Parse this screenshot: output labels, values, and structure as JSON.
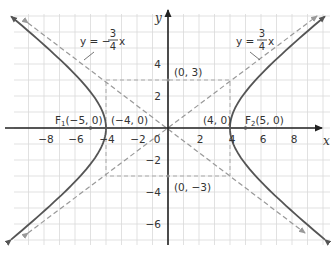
{
  "chart_data": {
    "type": "line",
    "title": "",
    "xlabel": "x",
    "ylabel": "y",
    "xlim": [
      -10,
      10
    ],
    "ylim": [
      -7,
      7.5
    ],
    "grid": true,
    "x_ticks": [
      -8,
      -6,
      -4,
      -2,
      2,
      4,
      6,
      8
    ],
    "y_ticks": [
      4,
      2,
      -2,
      -4,
      -6
    ],
    "origin_label": "0",
    "series": [
      {
        "name": "hyperbola",
        "equation": "x^2/16 - y^2/9 = 1",
        "style": "solid",
        "color": "#555555"
      },
      {
        "name": "asymptote_pos",
        "equation": "y = 3/4 x",
        "style": "dashed",
        "color": "#999999"
      },
      {
        "name": "asymptote_neg",
        "equation": "y = -3/4 x",
        "style": "dashed",
        "color": "#999999"
      }
    ],
    "rectangle": {
      "x": [
        -4,
        4
      ],
      "y": [
        -3,
        3
      ],
      "style": "dashed"
    },
    "annotations": [
      {
        "text": "F",
        "sub": "1",
        "rest": "(−5, 0)",
        "x": -5,
        "y": 0
      },
      {
        "text": "(−4, 0)",
        "x": -4,
        "y": 0
      },
      {
        "text": "(4, 0)",
        "x": 4,
        "y": 0
      },
      {
        "text": "F",
        "sub": "2",
        "rest": "(5, 0)",
        "x": 5,
        "y": 0
      },
      {
        "text": "(0, 3)",
        "x": 0,
        "y": 3
      },
      {
        "text": "(0, −3)",
        "x": 0,
        "y": -3
      }
    ],
    "asymptote_labels": [
      {
        "lhs": "y = ",
        "sign": "−",
        "num": "3",
        "den": "4",
        "var": "x"
      },
      {
        "lhs": "y = ",
        "sign": "",
        "num": "3",
        "den": "4",
        "var": "x"
      }
    ]
  },
  "labels": {
    "x_axis": "x",
    "y_axis": "y",
    "origin": "0",
    "ticks_x": [
      "−8",
      "−6",
      "−4",
      "−2",
      "2",
      "4",
      "6",
      "8"
    ],
    "ticks_y": [
      "4",
      "2",
      "−2",
      "−4",
      "−6"
    ],
    "f1_letter": "F",
    "f1_sub": "1",
    "f1_coords": "(−5, 0)",
    "vertex_left": "(−4, 0)",
    "vertex_right": "(4, 0)",
    "f2_letter": "F",
    "f2_sub": "2",
    "f2_coords": "(5, 0)",
    "covertex_top": "(0, 3)",
    "covertex_bottom": "(0, −3)",
    "asym_left_lhs": "y = −",
    "asym_left_num": "3",
    "asym_left_den": "4",
    "asym_left_var": "x",
    "asym_right_lhs": "y =",
    "asym_right_num": "3",
    "asym_right_den": "4",
    "asym_right_var": "x"
  }
}
